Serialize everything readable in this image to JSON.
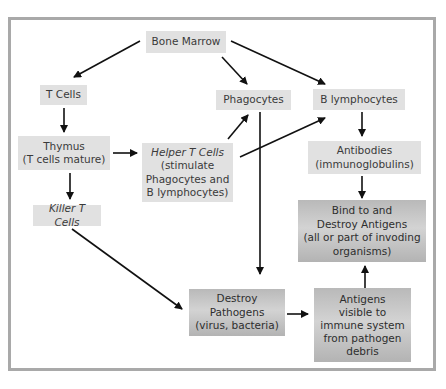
{
  "diagram": {
    "title": "",
    "colors": {
      "frame_border": "#a9a9a9",
      "node_light": "#e1e1e1",
      "node_dark": "#bdbdbd",
      "arrow": "#111111",
      "text": "#3a3a3a"
    },
    "nodes": {
      "bone_marrow": {
        "label": "Bone Marrow"
      },
      "t_cells": {
        "label": "T Cells"
      },
      "phagocytes": {
        "label": "Phagocytes"
      },
      "b_lymphocytes": {
        "label": "B lymphocytes"
      },
      "thymus": {
        "label": "Thymus\n(T cells mature)"
      },
      "helper_t_cells": {
        "label_title": "Helper T Cells",
        "label_detail": "(stimulate\nPhagocytes and\nB lymphocytes)"
      },
      "antibodies": {
        "label": "Antibodies\n(immunoglobulins)"
      },
      "killer_t_cells": {
        "label": "Killer T Cells"
      },
      "bind_destroy_antigens": {
        "label": "Bind to and\nDestroy Antigens\n(all or part of invoding\norganisms)"
      },
      "destroy_pathogens": {
        "label": "Destroy\nPathogens\n(virus, bacteria)"
      },
      "antigens_visible": {
        "label": "Antigens\nvisible to\nimmune system\nfrom pathogen\ndebris"
      }
    },
    "edges": [
      {
        "from": "Bone Marrow",
        "to": "T Cells"
      },
      {
        "from": "Bone Marrow",
        "to": "Phagocytes"
      },
      {
        "from": "Bone Marrow",
        "to": "B lymphocytes"
      },
      {
        "from": "T Cells",
        "to": "Thymus"
      },
      {
        "from": "Thymus",
        "to": "Helper T Cells"
      },
      {
        "from": "Thymus",
        "to": "Killer T Cells"
      },
      {
        "from": "Helper T Cells",
        "to": "Phagocytes"
      },
      {
        "from": "Helper T Cells",
        "to": "B lymphocytes"
      },
      {
        "from": "Phagocytes",
        "to": "Destroy Pathogens"
      },
      {
        "from": "B lymphocytes",
        "to": "Antibodies"
      },
      {
        "from": "Antibodies",
        "to": "Bind to and Destroy Antigens"
      },
      {
        "from": "Killer T Cells",
        "to": "Destroy Pathogens"
      },
      {
        "from": "Destroy Pathogens",
        "to": "Antigens visible to immune system"
      },
      {
        "from": "Antigens visible to immune system",
        "to": "Bind to and Destroy Antigens"
      }
    ]
  }
}
